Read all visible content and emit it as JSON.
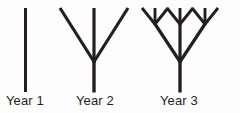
{
  "figure": {
    "background_color": "#fdfdfd",
    "ink_color": "#231f20",
    "stroke_width": 3,
    "labels": [
      {
        "text": "Year 1",
        "x": 6
      },
      {
        "text": "Year 2",
        "x": 76
      },
      {
        "text": "Year 3",
        "x": 160
      }
    ],
    "trees": [
      {
        "name": "year-1-tree",
        "stage": 1,
        "branch_count": 1,
        "description": "single vertical trunk",
        "segments": [
          {
            "name": "trunk",
            "x1": 25.5,
            "y1": 8,
            "x2": 25.5,
            "y2": 92
          }
        ]
      },
      {
        "name": "year-2-tree",
        "stage": 2,
        "branch_count": 3,
        "description": "trunk splitting into three branches (trident)",
        "segments": [
          {
            "name": "trunk",
            "x1": 94,
            "y1": 92,
            "x2": 94,
            "y2": 62
          },
          {
            "name": "branch-left",
            "x1": 94,
            "y1": 62,
            "x2": 60,
            "y2": 8
          },
          {
            "name": "branch-center",
            "x1": 94,
            "y1": 62,
            "x2": 94,
            "y2": 8
          },
          {
            "name": "branch-right",
            "x1": 94,
            "y1": 62,
            "x2": 128,
            "y2": 8
          }
        ]
      },
      {
        "name": "year-3-tree",
        "stage": 3,
        "branch_count": 9,
        "description": "trunk splitting into three branches, each splitting into three more",
        "segments": [
          {
            "name": "trunk",
            "x1": 180,
            "y1": 92,
            "x2": 180,
            "y2": 62
          },
          {
            "name": "branch-left",
            "x1": 180,
            "y1": 62,
            "x2": 155,
            "y2": 24
          },
          {
            "name": "branch-center",
            "x1": 180,
            "y1": 62,
            "x2": 180,
            "y2": 24
          },
          {
            "name": "branch-right",
            "x1": 180,
            "y1": 62,
            "x2": 205,
            "y2": 24
          },
          {
            "name": "twig-left-a",
            "x1": 155,
            "y1": 24,
            "x2": 142,
            "y2": 8
          },
          {
            "name": "twig-left-b",
            "x1": 155,
            "y1": 24,
            "x2": 155,
            "y2": 8
          },
          {
            "name": "twig-left-c",
            "x1": 155,
            "y1": 24,
            "x2": 168,
            "y2": 8
          },
          {
            "name": "twig-center-a",
            "x1": 180,
            "y1": 24,
            "x2": 167,
            "y2": 8
          },
          {
            "name": "twig-center-b",
            "x1": 180,
            "y1": 24,
            "x2": 180,
            "y2": 8
          },
          {
            "name": "twig-center-c",
            "x1": 180,
            "y1": 24,
            "x2": 193,
            "y2": 8
          },
          {
            "name": "twig-right-a",
            "x1": 205,
            "y1": 24,
            "x2": 192,
            "y2": 8
          },
          {
            "name": "twig-right-b",
            "x1": 205,
            "y1": 24,
            "x2": 205,
            "y2": 8
          },
          {
            "name": "twig-right-c",
            "x1": 205,
            "y1": 24,
            "x2": 218,
            "y2": 8
          }
        ]
      }
    ]
  }
}
